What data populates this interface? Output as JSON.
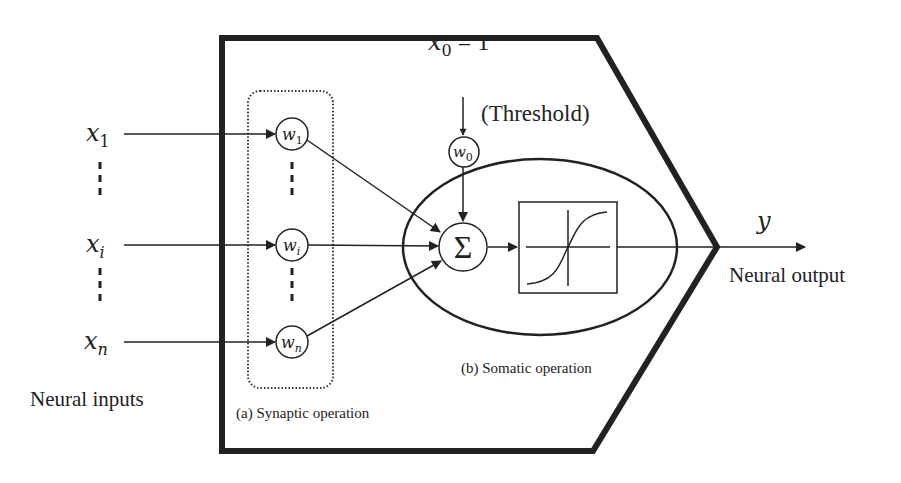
{
  "diagram": {
    "inputs": {
      "label": "Neural inputs",
      "items": [
        {
          "symbol": "x",
          "sub": "1"
        },
        {
          "symbol": "x",
          "sub": "i"
        },
        {
          "symbol": "x",
          "sub": "n"
        }
      ]
    },
    "weights": [
      {
        "symbol": "w",
        "sub": "1"
      },
      {
        "symbol": "w",
        "sub": "i"
      },
      {
        "symbol": "w",
        "sub": "n"
      }
    ],
    "threshold": {
      "input_symbol": "x",
      "input_sub": "0",
      "input_value": " = 1",
      "label": "(Threshold)",
      "weight_symbol": "w",
      "weight_sub": "0"
    },
    "summation": {
      "symbol": "Σ"
    },
    "activation": {
      "type": "sigmoid"
    },
    "output": {
      "symbol": "y",
      "label": "Neural output"
    },
    "sections": {
      "synaptic": "(a) Synaptic operation",
      "somatic": "(b) Somatic operation"
    },
    "colors": {
      "stroke": "#222222",
      "background": "#ffffff"
    }
  }
}
